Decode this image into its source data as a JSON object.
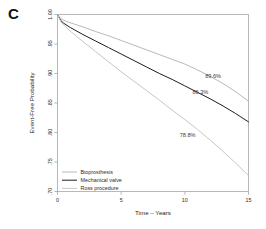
{
  "panel": {
    "letter": "C"
  },
  "chart_data": {
    "type": "line",
    "title": "",
    "subtitle": "",
    "xlabel": "Time – Years",
    "ylabel": "Event-Free Probability",
    "xlim": [
      0,
      15
    ],
    "ylim": [
      0.7,
      1.0
    ],
    "xticks": [
      0,
      5,
      10,
      15
    ],
    "xticklabels": [
      "0",
      "5",
      "10",
      "15"
    ],
    "yticks": [
      0.7,
      0.75,
      0.8,
      0.85,
      0.9,
      0.95,
      1.0
    ],
    "yticklabels": [
      ".70",
      ".75",
      ".80",
      ".85",
      ".90",
      ".95",
      "1.00"
    ],
    "grid": false,
    "legend_position": "bottom-left",
    "series": [
      {
        "name": "Bioprosthesis",
        "color": "#b9b9b9",
        "endpoint_label": "89.6%",
        "endpoint_label_x": 11.6,
        "endpoint_label_y": 0.893,
        "x": [
          0,
          0.25,
          0.5,
          1,
          2,
          3,
          4,
          5,
          6,
          7,
          8,
          9,
          10,
          11,
          12,
          13,
          14,
          15
        ],
        "y": [
          1.0,
          0.993,
          0.99,
          0.986,
          0.979,
          0.971,
          0.964,
          0.956,
          0.948,
          0.94,
          0.932,
          0.924,
          0.916,
          0.906,
          0.895,
          0.883,
          0.869,
          0.853
        ]
      },
      {
        "name": "Mechanical valve",
        "color": "#1d1d1d",
        "endpoint_label": "86.3%",
        "endpoint_label_x": 10.6,
        "endpoint_label_y": 0.866,
        "x": [
          0,
          0.25,
          0.5,
          1,
          2,
          3,
          4,
          5,
          6,
          7,
          8,
          9,
          10,
          11,
          12,
          13,
          14,
          15
        ],
        "y": [
          1.0,
          0.99,
          0.985,
          0.978,
          0.966,
          0.955,
          0.944,
          0.933,
          0.922,
          0.911,
          0.9,
          0.89,
          0.879,
          0.868,
          0.857,
          0.845,
          0.832,
          0.818
        ]
      },
      {
        "name": "Ross procedure",
        "color": "#c6c6c6",
        "endpoint_label": "78.8%",
        "endpoint_label_x": 9.6,
        "endpoint_label_y": 0.793,
        "x": [
          0,
          0.25,
          0.5,
          1,
          2,
          3,
          4,
          5,
          6,
          7,
          8,
          9,
          10,
          11,
          12,
          13,
          14,
          15
        ],
        "y": [
          1.0,
          0.988,
          0.982,
          0.972,
          0.954,
          0.937,
          0.92,
          0.903,
          0.887,
          0.871,
          0.855,
          0.838,
          0.822,
          0.805,
          0.787,
          0.768,
          0.748,
          0.727
        ]
      }
    ]
  },
  "legend": {
    "items": [
      {
        "label": "Bioprosthesis",
        "color": "#b9b9b9"
      },
      {
        "label": "Mechanical valve",
        "color": "#1d1d1d"
      },
      {
        "label": "Ross procedure",
        "color": "#c6c6c6"
      }
    ]
  }
}
